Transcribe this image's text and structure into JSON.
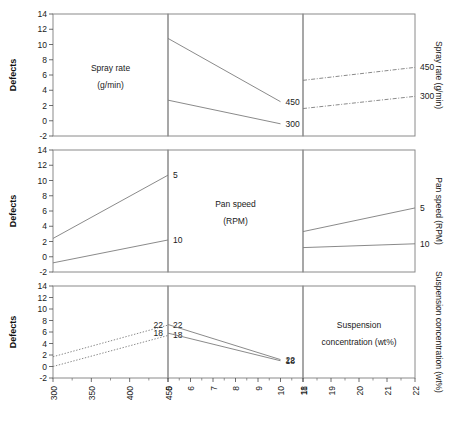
{
  "figure": {
    "y_axis_title": "Defects",
    "factors": [
      {
        "id": "spray",
        "name_line1": "Spray rate",
        "name_line2": "(g/min)",
        "right_label": "Spray rate (g/min)"
      },
      {
        "id": "panspeed",
        "name_line1": "Pan speed",
        "name_line2": "(RPM)",
        "right_label": "Pan speed (RPM)"
      },
      {
        "id": "suspension",
        "name_line1": "Suspension",
        "name_line2": "concentration (wt%)",
        "right_label": "Suspension concentration (wt%)"
      }
    ],
    "y_ticks": [
      "14",
      "12",
      "10",
      "8",
      "6",
      "4",
      "2",
      "0",
      "-2"
    ],
    "x_axes": [
      {
        "id": "spray-axis",
        "ticks": [
          "300",
          "350",
          "400",
          "450"
        ]
      },
      {
        "id": "panspeed-axis",
        "ticks": [
          "5",
          "6",
          "7",
          "8",
          "9",
          "10",
          "11"
        ]
      },
      {
        "id": "suspension-axis",
        "ticks": [
          "18",
          "19",
          "20",
          "21",
          "22"
        ]
      }
    ],
    "line_color": "#7d7d7d",
    "frame_color": "#8a8a8a"
  },
  "chart_data": {
    "type": "line",
    "title": "",
    "ylabel": "Defects",
    "ylim": [
      -2,
      14
    ],
    "y_ticks": [
      14,
      12,
      10,
      8,
      6,
      4,
      2,
      0,
      -2
    ],
    "layout": "3x3 interaction plot matrix",
    "grid": false,
    "legend": "inline labels at line right ends",
    "panels": [
      {
        "row": 1,
        "col": 1,
        "kind": "diagonal",
        "label": "Spray rate (g/min)"
      },
      {
        "row": 1,
        "col": 2,
        "kind": "interaction",
        "x_factor": "Pan speed (RPM)",
        "xlim": [
          5,
          11
        ],
        "trace_factor": "Spray rate (g/min)",
        "linestyle": "solid",
        "series": [
          {
            "name": "450",
            "x": [
              5,
              10
            ],
            "values": [
              10.8,
              2.5
            ]
          },
          {
            "name": "300",
            "x": [
              5,
              10
            ],
            "values": [
              2.7,
              -0.4
            ]
          }
        ]
      },
      {
        "row": 1,
        "col": 3,
        "kind": "interaction",
        "x_factor": "Suspension concentration (wt%)",
        "xlim": [
          18,
          22
        ],
        "trace_factor": "Spray rate (g/min)",
        "linestyle": "dashdot",
        "series": [
          {
            "name": "450",
            "x": [
              18,
              22
            ],
            "values": [
              5.3,
              7.0
            ]
          },
          {
            "name": "300",
            "x": [
              18,
              22
            ],
            "values": [
              1.6,
              3.2
            ]
          }
        ]
      },
      {
        "row": 2,
        "col": 1,
        "kind": "interaction",
        "x_factor": "Spray rate (g/min)",
        "xlim": [
          300,
          450
        ],
        "trace_factor": "Pan speed (RPM)",
        "linestyle": "solid",
        "series": [
          {
            "name": "5",
            "x": [
              300,
              450
            ],
            "values": [
              2.4,
              10.7
            ]
          },
          {
            "name": "10",
            "x": [
              300,
              450
            ],
            "values": [
              -0.8,
              2.2
            ]
          }
        ]
      },
      {
        "row": 2,
        "col": 2,
        "kind": "diagonal",
        "label": "Pan speed (RPM)"
      },
      {
        "row": 2,
        "col": 3,
        "kind": "interaction",
        "x_factor": "Suspension concentration (wt%)",
        "xlim": [
          18,
          22
        ],
        "trace_factor": "Pan speed (RPM)",
        "linestyle": "solid",
        "series": [
          {
            "name": "5",
            "x": [
              18,
              22
            ],
            "values": [
              3.3,
              6.4
            ]
          },
          {
            "name": "10",
            "x": [
              18,
              22
            ],
            "values": [
              1.2,
              1.7
            ]
          }
        ]
      },
      {
        "row": 3,
        "col": 1,
        "kind": "interaction",
        "x_factor": "Spray rate (g/min)",
        "xlim": [
          300,
          450
        ],
        "trace_factor": "Suspension concentration (wt%)",
        "linestyle": "dotted",
        "series": [
          {
            "name": "22",
            "x": [
              300,
              450
            ],
            "values": [
              1.7,
              7.2
            ]
          },
          {
            "name": "18",
            "x": [
              300,
              450
            ],
            "values": [
              0.0,
              5.4
            ]
          }
        ]
      },
      {
        "row": 3,
        "col": 2,
        "kind": "interaction",
        "x_factor": "Pan speed (RPM)",
        "xlim": [
          5,
          11
        ],
        "trace_factor": "Suspension concentration (wt%)",
        "linestyle": "solid",
        "left_labels": [
          "22",
          "18"
        ],
        "series": [
          {
            "name": "22",
            "x": [
              5,
              10
            ],
            "values": [
              7.3,
              1.2
            ]
          },
          {
            "name": "18",
            "x": [
              5,
              10
            ],
            "values": [
              5.8,
              1.0
            ]
          }
        ]
      },
      {
        "row": 3,
        "col": 3,
        "kind": "diagonal",
        "label": "Suspension concentration (wt%)"
      }
    ]
  }
}
